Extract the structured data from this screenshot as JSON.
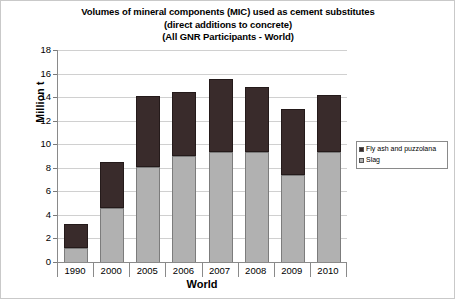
{
  "chart_data": {
    "type": "bar",
    "stacked": true,
    "title": "Volumes of mineral components (MIC) used as cement substitutes (direct additions to concrete) (All GNR Participants - World)",
    "title_lines": [
      "Volumes of mineral components (MIC) used as cement substitutes",
      "(direct additions to concrete)",
      "(All GNR Participants - World)"
    ],
    "xlabel": "World",
    "ylabel": "Million t",
    "categories": [
      "1990",
      "2000",
      "2005",
      "2006",
      "2007",
      "2008",
      "2009",
      "2010"
    ],
    "series": [
      {
        "name": "Slag",
        "color": "#b1b1b1",
        "values": [
          1.2,
          4.6,
          8.1,
          9.0,
          9.3,
          9.3,
          7.4,
          9.3
        ]
      },
      {
        "name": "Fly ash and puzzolana",
        "color": "#392b2b",
        "values": [
          2.0,
          3.9,
          6.0,
          5.4,
          6.2,
          5.6,
          5.6,
          4.9
        ]
      }
    ],
    "totals": [
      3.2,
      8.5,
      14.1,
      14.4,
      15.5,
      14.9,
      13.0,
      14.2
    ],
    "ylim": [
      0,
      18
    ],
    "yticks": [
      0,
      2,
      4,
      6,
      8,
      10,
      12,
      14,
      16,
      18
    ],
    "ytick_labels": [
      "0",
      "2",
      "4",
      "6",
      "8",
      "10",
      "12",
      "14",
      "16",
      "18"
    ],
    "grid": true,
    "legend_position": "right",
    "legend_entries": [
      {
        "label": "Fly ash and puzzolana",
        "color": "#392b2b"
      },
      {
        "label": "Slag",
        "color": "#b1b1b1"
      }
    ]
  }
}
